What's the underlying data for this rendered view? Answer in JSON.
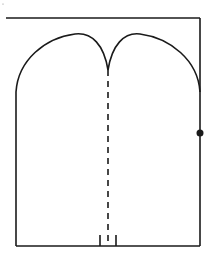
{
  "diagram": {
    "stroke_color": "#1a1a1a",
    "background": "#ffffff",
    "elements": {
      "top_line": {
        "x1": 6,
        "y1": 18,
        "x2": 200,
        "y2": 18
      },
      "right_wall": {
        "x1": 200,
        "y1": 18,
        "x2": 200,
        "y2": 246
      },
      "left_wall": {
        "x1": 16,
        "y1": 92,
        "x2": 16,
        "y2": 246
      },
      "bottom_line": {
        "x1": 16,
        "y1": 246,
        "x2": 200,
        "y2": 246
      },
      "center_dashed_line": {
        "x": 108,
        "y1": 70,
        "y2": 242
      },
      "right_dot": {
        "cx": 200,
        "cy": 133,
        "r": 3.5
      },
      "bottom_ticks": [
        {
          "x": 100,
          "y1": 235,
          "y2": 246
        },
        {
          "x": 116,
          "y1": 235,
          "y2": 246
        }
      ]
    }
  }
}
